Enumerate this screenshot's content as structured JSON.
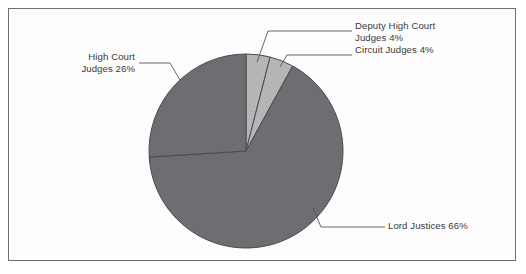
{
  "figure": {
    "background_color": "#fdfdfd",
    "frame_color": "#6f6f73",
    "text_color": "#3a3a40",
    "leader_line_color": "#55555b"
  },
  "chart_data": {
    "type": "pie",
    "title": "",
    "subtitle": "",
    "xlabel": "",
    "ylabel": "",
    "legend_position": "none",
    "grid": false,
    "start_angle_deg": 90,
    "direction": "clockwise",
    "categories": [
      "Deputy High Court Judges",
      "Circuit Judges",
      "Lord Justices",
      "High Court Judges"
    ],
    "values": [
      4,
      4,
      66,
      26
    ],
    "value_unit": "%",
    "colors": [
      "#b5b5b5",
      "#b5b5b5",
      "#6e6e72",
      "#6e6e72"
    ],
    "slices": [
      {
        "label": "Deputy High Court Judges",
        "value": 4,
        "display": "Deputy High Court Judges 4%",
        "color": "#b5b5b5"
      },
      {
        "label": "Circuit Judges",
        "value": 4,
        "display": "Circuit Judges 4%",
        "color": "#b5b5b5"
      },
      {
        "label": "Lord Justices",
        "value": 66,
        "display": "Lord Justices 66%",
        "color": "#6e6e72"
      },
      {
        "label": "High Court Judges",
        "value": 26,
        "display": "High Court Judges 26%",
        "color": "#6e6e72"
      }
    ]
  },
  "labels": {
    "deputy_high_court_line1": "Deputy High Court",
    "deputy_high_court_line2": "Judges 4%",
    "circuit_judges": "Circuit Judges 4%",
    "high_court_line1": "High Court",
    "high_court_line2": "Judges 26%",
    "lord_justices": "Lord Justices 66%"
  }
}
